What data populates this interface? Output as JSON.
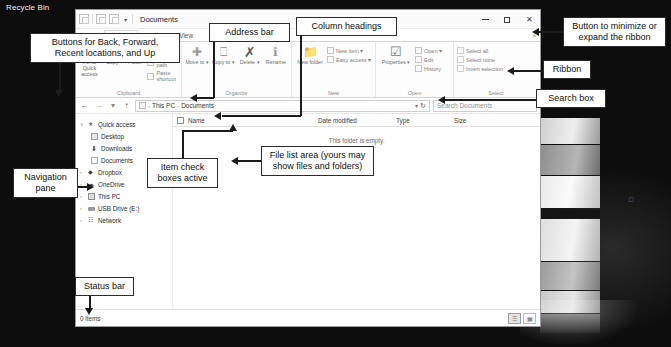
{
  "desktop": {
    "recycle_bin_label": "Recycle Bin"
  },
  "window": {
    "title": "Documents",
    "quick_access_toolbar": [
      "properties-icon",
      "new-folder-icon",
      "undo-icon"
    ],
    "qat_caret": "▾",
    "controls": {
      "minimize": "minimize-icon",
      "maximize": "maximize-icon",
      "close": "✕"
    }
  },
  "tabs": [
    {
      "label": "File",
      "active": false
    },
    {
      "label": "Home",
      "active": true
    },
    {
      "label": "Share",
      "active": false
    },
    {
      "label": "View",
      "active": false
    }
  ],
  "ribbon_toggle": "^",
  "ribbon": {
    "groups": [
      {
        "name": "Clipboard",
        "label": "Clipboard",
        "big_buttons": [
          {
            "label": "Pin to Quick\naccess",
            "icon": "pin-icon"
          },
          {
            "label": "Copy",
            "icon": "copy-icon"
          },
          {
            "label": "Paste",
            "icon": "paste-icon"
          }
        ],
        "small_buttons": [
          {
            "label": "Cut",
            "icon": "cut-icon"
          },
          {
            "label": "Copy path",
            "icon": "copy-path-icon"
          },
          {
            "label": "Paste shortcut",
            "icon": "paste-shortcut-icon"
          }
        ]
      },
      {
        "name": "Organize",
        "label": "Organize",
        "big_buttons": [
          {
            "label": "Move\nto ▾",
            "icon": "move-to-icon"
          },
          {
            "label": "Copy\nto ▾",
            "icon": "copy-to-icon"
          },
          {
            "label": "Delete\n▾",
            "icon": "delete-icon"
          },
          {
            "label": "Rename",
            "icon": "rename-icon"
          }
        ],
        "small_buttons": []
      },
      {
        "name": "New",
        "label": "New",
        "big_buttons": [
          {
            "label": "New\nfolder",
            "icon": "new-folder-icon"
          }
        ],
        "small_buttons": [
          {
            "label": "New item ▾",
            "icon": "new-item-icon"
          },
          {
            "label": "Easy access ▾",
            "icon": "easy-access-icon"
          }
        ]
      },
      {
        "name": "Open",
        "label": "Open",
        "big_buttons": [
          {
            "label": "Properties\n▾",
            "icon": "properties-icon"
          }
        ],
        "small_buttons": [
          {
            "label": "Open ▾",
            "icon": "open-icon"
          },
          {
            "label": "Edit",
            "icon": "edit-icon"
          },
          {
            "label": "History",
            "icon": "history-icon"
          }
        ]
      },
      {
        "name": "Select",
        "label": "Select",
        "big_buttons": [],
        "small_buttons": [
          {
            "label": "Select all",
            "icon": "select-all-icon"
          },
          {
            "label": "Select none",
            "icon": "select-none-icon"
          },
          {
            "label": "Invert selection",
            "icon": "invert-selection-icon"
          }
        ]
      }
    ]
  },
  "address_bar": {
    "back": "←",
    "forward": "→",
    "recent": "▾",
    "up": "↑",
    "folder_icon": "folder-icon",
    "breadcrumbs": [
      "This PC",
      "Documents"
    ],
    "separator": "›",
    "dropdown_caret": "▾",
    "refresh": "↻"
  },
  "search": {
    "placeholder": "Search Documents",
    "value": "Search Documents"
  },
  "navigation_pane": {
    "items": [
      {
        "label": "Quick access",
        "icon": "star-icon",
        "indent": 0,
        "expander": "∨"
      },
      {
        "label": "Desktop",
        "icon": "desktop-icon",
        "indent": 1,
        "expander": ""
      },
      {
        "label": "Downloads",
        "icon": "downloads-icon",
        "indent": 1,
        "expander": ""
      },
      {
        "label": "Documents",
        "icon": "documents-icon",
        "indent": 1,
        "expander": ""
      },
      {
        "label": "Dropbox",
        "icon": "dropbox-icon",
        "indent": 0,
        "expander": "›"
      },
      {
        "label": "OneDrive",
        "icon": "onedrive-icon",
        "indent": 0,
        "expander": "›"
      },
      {
        "label": "This PC",
        "icon": "this-pc-icon",
        "indent": 0,
        "expander": "›"
      },
      {
        "label": "USB Drive (E:)",
        "icon": "usb-drive-icon",
        "indent": 0,
        "expander": "›"
      },
      {
        "label": "Network",
        "icon": "network-icon",
        "indent": 0,
        "expander": "›"
      }
    ]
  },
  "file_list": {
    "columns": [
      "Name",
      "Date modified",
      "Type",
      "Size"
    ],
    "rows": [],
    "empty_message": "This folder is empty."
  },
  "status_bar": {
    "item_count": "0 items",
    "view_details_icon": "details-view-icon",
    "view_large_icons_icon": "large-icons-view-icon"
  },
  "annotations": [
    {
      "id": "nav-buttons",
      "text": "Buttons for Back, Forward,\nRecent locations, and Up"
    },
    {
      "id": "address-bar",
      "text": "Address bar"
    },
    {
      "id": "column-headings",
      "text": "Column headings"
    },
    {
      "id": "ribbon-toggle-note",
      "text": "Button to minimize or\nexpand the ribbon"
    },
    {
      "id": "ribbon",
      "text": "Ribbon"
    },
    {
      "id": "search-box",
      "text": "Search box"
    },
    {
      "id": "navigation-pane",
      "text": "Navigation\npane"
    },
    {
      "id": "check-boxes",
      "text": "Item check\nboxes active"
    },
    {
      "id": "file-list-area",
      "text": "File list area (yours may\nshow files and folders)"
    },
    {
      "id": "status-bar",
      "text": "Status bar"
    }
  ]
}
